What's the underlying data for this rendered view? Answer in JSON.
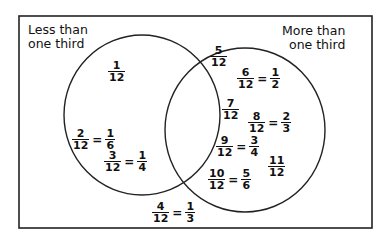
{
  "diagram": {
    "type": "venn",
    "sets": [
      {
        "id": "left",
        "label_line1": "Less than",
        "label_line2": "one third"
      },
      {
        "id": "right",
        "label_line1": "More than",
        "label_line2": "one third"
      }
    ],
    "items": {
      "left_only": [
        {
          "n": "1",
          "d": "12"
        },
        {
          "n": "2",
          "d": "12",
          "eq_n": "1",
          "eq_d": "6"
        },
        {
          "n": "3",
          "d": "12",
          "eq_n": "1",
          "eq_d": "4"
        }
      ],
      "right_only": [
        {
          "n": "5",
          "d": "12"
        },
        {
          "n": "6",
          "d": "12",
          "eq_n": "1",
          "eq_d": "2"
        },
        {
          "n": "7",
          "d": "12"
        },
        {
          "n": "8",
          "d": "12",
          "eq_n": "2",
          "eq_d": "3"
        },
        {
          "n": "9",
          "d": "12",
          "eq_n": "3",
          "eq_d": "4"
        },
        {
          "n": "10",
          "d": "12",
          "eq_n": "5",
          "eq_d": "6"
        },
        {
          "n": "11",
          "d": "12"
        }
      ],
      "intersection": [],
      "outside": [
        {
          "n": "4",
          "d": "12",
          "eq_n": "1",
          "eq_d": "3"
        }
      ]
    },
    "equals": "="
  }
}
